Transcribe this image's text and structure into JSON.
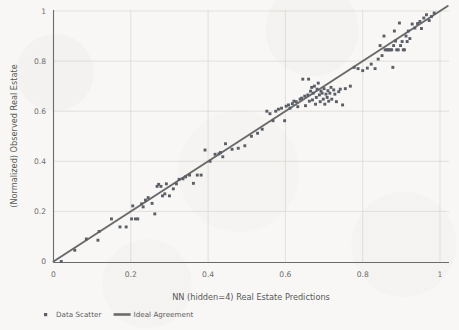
{
  "figure": {
    "background_color": "#f8f7f5",
    "ink_color": "#5a5f66",
    "line_color": "#6a6a6a",
    "grid_color": "#d9d7d3"
  },
  "axes": {
    "x_title": "NN (hidden=4) Real Estate Predictions",
    "y_title": "(Normalized) Observed Real Estate",
    "x_ticks": [
      "0",
      "0.2",
      "0.4",
      "0.6",
      "0.8",
      "1"
    ],
    "y_ticks": [
      "0",
      "0.2",
      "0.4",
      "0.6",
      "0.8",
      "1"
    ]
  },
  "legend": {
    "items": [
      {
        "label": "Data Scatter",
        "marker": "square",
        "color": "#5a5f66"
      },
      {
        "label": "Ideal Agreement",
        "marker": "line",
        "color": "#6a6a6a"
      }
    ]
  },
  "chart_data": {
    "type": "scatter",
    "title": "",
    "xlabel": "NN (hidden=4) Real Estate Predictions",
    "ylabel": "(Normalized) Observed Real Estate",
    "xlim": [
      0,
      1.04
    ],
    "ylim": [
      0,
      1.04
    ],
    "xticks": [
      0,
      0.2,
      0.4,
      0.6,
      0.8,
      1
    ],
    "yticks": [
      0,
      0.2,
      0.4,
      0.6,
      0.8,
      1
    ],
    "grid": true,
    "legend_position": "below-axes-left",
    "series": [
      {
        "name": "Data Scatter",
        "type": "scatter",
        "marker": "square",
        "color": "#5a5f66",
        "points": [
          [
            0.02,
            0.0
          ],
          [
            0.055,
            0.045
          ],
          [
            0.085,
            0.09
          ],
          [
            0.118,
            0.12
          ],
          [
            0.115,
            0.085
          ],
          [
            0.15,
            0.17
          ],
          [
            0.172,
            0.138
          ],
          [
            0.188,
            0.138
          ],
          [
            0.202,
            0.17
          ],
          [
            0.212,
            0.17
          ],
          [
            0.218,
            0.17
          ],
          [
            0.205,
            0.222
          ],
          [
            0.228,
            0.23
          ],
          [
            0.232,
            0.218
          ],
          [
            0.238,
            0.245
          ],
          [
            0.245,
            0.255
          ],
          [
            0.255,
            0.232
          ],
          [
            0.262,
            0.19
          ],
          [
            0.268,
            0.3
          ],
          [
            0.272,
            0.308
          ],
          [
            0.278,
            0.3
          ],
          [
            0.282,
            0.262
          ],
          [
            0.288,
            0.27
          ],
          [
            0.292,
            0.31
          ],
          [
            0.3,
            0.262
          ],
          [
            0.31,
            0.29
          ],
          [
            0.318,
            0.31
          ],
          [
            0.325,
            0.328
          ],
          [
            0.335,
            0.33
          ],
          [
            0.342,
            0.338
          ],
          [
            0.352,
            0.345
          ],
          [
            0.362,
            0.312
          ],
          [
            0.372,
            0.345
          ],
          [
            0.382,
            0.345
          ],
          [
            0.392,
            0.445
          ],
          [
            0.405,
            0.4
          ],
          [
            0.418,
            0.428
          ],
          [
            0.428,
            0.43
          ],
          [
            0.432,
            0.435
          ],
          [
            0.438,
            0.418
          ],
          [
            0.445,
            0.47
          ],
          [
            0.462,
            0.448
          ],
          [
            0.478,
            0.452
          ],
          [
            0.495,
            0.462
          ],
          [
            0.512,
            0.5
          ],
          [
            0.528,
            0.512
          ],
          [
            0.54,
            0.528
          ],
          [
            0.552,
            0.6
          ],
          [
            0.56,
            0.59
          ],
          [
            0.568,
            0.562
          ],
          [
            0.575,
            0.6
          ],
          [
            0.582,
            0.608
          ],
          [
            0.59,
            0.612
          ],
          [
            0.598,
            0.562
          ],
          [
            0.602,
            0.62
          ],
          [
            0.608,
            0.625
          ],
          [
            0.612,
            0.612
          ],
          [
            0.618,
            0.63
          ],
          [
            0.622,
            0.64
          ],
          [
            0.628,
            0.638
          ],
          [
            0.632,
            0.618
          ],
          [
            0.638,
            0.648
          ],
          [
            0.642,
            0.652
          ],
          [
            0.645,
            0.728
          ],
          [
            0.65,
            0.66
          ],
          [
            0.652,
            0.622
          ],
          [
            0.658,
            0.665
          ],
          [
            0.66,
            0.728
          ],
          [
            0.662,
            0.64
          ],
          [
            0.665,
            0.68
          ],
          [
            0.668,
            0.695
          ],
          [
            0.67,
            0.645
          ],
          [
            0.672,
            0.672
          ],
          [
            0.675,
            0.7
          ],
          [
            0.678,
            0.628
          ],
          [
            0.68,
            0.655
          ],
          [
            0.682,
            0.688
          ],
          [
            0.685,
            0.712
          ],
          [
            0.688,
            0.665
          ],
          [
            0.69,
            0.638
          ],
          [
            0.692,
            0.68
          ],
          [
            0.695,
            0.672
          ],
          [
            0.698,
            0.648
          ],
          [
            0.7,
            0.69
          ],
          [
            0.702,
            0.628
          ],
          [
            0.705,
            0.668
          ],
          [
            0.708,
            0.655
          ],
          [
            0.71,
            0.682
          ],
          [
            0.712,
            0.64
          ],
          [
            0.715,
            0.672
          ],
          [
            0.718,
            0.695
          ],
          [
            0.72,
            0.648
          ],
          [
            0.725,
            0.685
          ],
          [
            0.728,
            0.668
          ],
          [
            0.732,
            0.638
          ],
          [
            0.738,
            0.678
          ],
          [
            0.742,
            0.688
          ],
          [
            0.748,
            0.625
          ],
          [
            0.755,
            0.69
          ],
          [
            0.768,
            0.7
          ],
          [
            0.778,
            0.775
          ],
          [
            0.788,
            0.77
          ],
          [
            0.8,
            0.762
          ],
          [
            0.812,
            0.772
          ],
          [
            0.822,
            0.788
          ],
          [
            0.832,
            0.77
          ],
          [
            0.84,
            0.808
          ],
          [
            0.845,
            0.862
          ],
          [
            0.85,
            0.822
          ],
          [
            0.855,
            0.9
          ],
          [
            0.858,
            0.845
          ],
          [
            0.862,
            0.845
          ],
          [
            0.865,
            0.845
          ],
          [
            0.868,
            0.845
          ],
          [
            0.872,
            0.845
          ],
          [
            0.875,
            0.845
          ],
          [
            0.878,
            0.775
          ],
          [
            0.88,
            0.862
          ],
          [
            0.882,
            0.92
          ],
          [
            0.885,
            0.88
          ],
          [
            0.888,
            0.845
          ],
          [
            0.892,
            0.845
          ],
          [
            0.895,
            0.952
          ],
          [
            0.898,
            0.862
          ],
          [
            0.902,
            0.878
          ],
          [
            0.905,
            0.845
          ],
          [
            0.908,
            0.845
          ],
          [
            0.912,
            0.9
          ],
          [
            0.915,
            0.878
          ],
          [
            0.918,
            0.92
          ],
          [
            0.922,
            0.89
          ],
          [
            0.928,
            0.948
          ],
          [
            0.935,
            0.932
          ],
          [
            0.942,
            0.95
          ],
          [
            0.948,
            0.958
          ],
          [
            0.952,
            0.93
          ],
          [
            0.958,
            0.972
          ],
          [
            0.965,
            0.985
          ],
          [
            0.972,
            0.962
          ],
          [
            0.978,
            0.978
          ],
          [
            0.985,
            0.992
          ]
        ]
      },
      {
        "name": "Ideal Agreement",
        "type": "line",
        "color": "#6a6a6a",
        "x": [
          0,
          1.02
        ],
        "y": [
          0,
          1.02
        ]
      }
    ]
  }
}
